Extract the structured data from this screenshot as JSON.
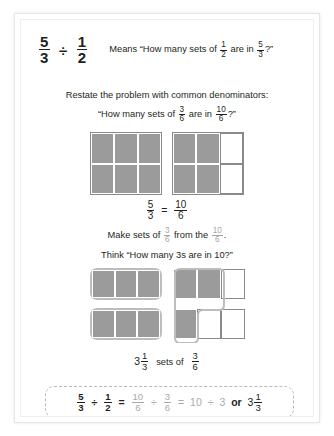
{
  "header": {
    "expression": {
      "left_num": "5",
      "left_den": "3",
      "divide": "÷",
      "right_num": "1",
      "right_den": "2"
    },
    "means_prefix": "Means “How many sets of",
    "means_frac1_num": "1",
    "means_frac1_den": "2",
    "means_middle": "are in",
    "means_frac2_num": "5",
    "means_frac2_den": "3",
    "means_suffix": "?”"
  },
  "restate": {
    "line1": "Restate the problem with common denominators:",
    "line2_prefix": "“How many sets of",
    "line2_frac1_num": "3",
    "line2_frac1_den": "6",
    "line2_middle": "are in",
    "line2_frac2_num": "10",
    "line2_frac2_den": "6",
    "line2_suffix": "?”"
  },
  "diagram1": {
    "squares": [
      {
        "name": "whole-square",
        "cells": [
          "filled",
          "filled",
          "filled",
          "filled",
          "filled",
          "filled"
        ]
      },
      {
        "name": "partial-square",
        "cells": [
          "filled",
          "filled",
          "empty",
          "filled",
          "filled",
          "empty"
        ]
      }
    ],
    "equation": {
      "left_num": "5",
      "left_den": "3",
      "equals": "=",
      "right_num": "10",
      "right_den": "6"
    }
  },
  "makesets": {
    "line1_prefix": "Make sets of",
    "line1_frac1_num": "3",
    "line1_frac1_den": "6",
    "line1_middle": "from the",
    "line1_frac2_num": "10",
    "line1_frac2_den": "6",
    "line1_suffix": ".",
    "line2": "Think “How many 3s are in 10?”"
  },
  "diagram2": {
    "left_panel": {
      "top_group_tiles": [
        "filled",
        "filled",
        "filled"
      ],
      "bottom_group_tiles": [
        "filled",
        "filled",
        "filled"
      ]
    },
    "right_panel": {
      "row1": [
        "filled",
        "filled",
        "empty"
      ],
      "row2": [
        "filled",
        "empty",
        "empty"
      ]
    }
  },
  "setsof": {
    "whole": "3",
    "mixed_num": "1",
    "mixed_den": "3",
    "label": "sets of",
    "frac_num": "3",
    "frac_den": "6"
  },
  "final": {
    "a_num": "5",
    "a_den": "3",
    "op1": "÷",
    "b_num": "1",
    "b_den": "2",
    "eq1": "=",
    "c_num": "10",
    "c_den": "6",
    "op2": "÷",
    "d_num": "3",
    "d_den": "6",
    "eq2": "=",
    "ten": "10",
    "op3": "÷",
    "three": "3",
    "or": "or",
    "result_whole": "3",
    "result_num": "1",
    "result_den": "3"
  },
  "colors": {
    "fill_gray": "#9b9b9b",
    "outline_gray": "#8a8a8a",
    "group_border": "#bdbdbd",
    "text": "#231f20",
    "muted": "#a9a9a9",
    "dashed_border": "#b9b9b9"
  }
}
